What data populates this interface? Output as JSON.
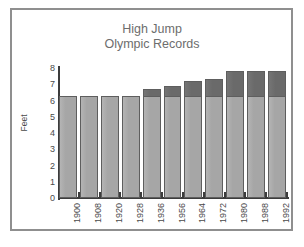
{
  "figure": {
    "background_color": "#ffffff",
    "frame_color": "#8f8f8f"
  },
  "chart_data": {
    "type": "bar",
    "title": "High Jump Olympic Records",
    "title_lines": [
      "High Jump",
      "Olympic Records"
    ],
    "xlabel": "",
    "ylabel": "Feet",
    "ylim": [
      0,
      8
    ],
    "yticks": [
      0,
      1,
      2,
      3,
      4,
      5,
      6,
      7,
      8
    ],
    "ytick_labels": [
      "0",
      "1",
      "2",
      "3",
      "4",
      "5",
      "6",
      "7",
      "8"
    ],
    "grid": false,
    "legend": null,
    "categories": [
      "1900",
      "1908",
      "1920",
      "1928",
      "1936",
      "1956",
      "1964",
      "1972",
      "1980",
      "1988",
      "1992"
    ],
    "values": [
      6.3,
      6.3,
      6.3,
      6.3,
      6.7,
      6.9,
      7.2,
      7.3,
      7.8,
      7.8,
      7.8
    ],
    "base_segment_value": 6.3,
    "series": [
      {
        "name": "Record height (base)",
        "color": "#a6a6a6",
        "values": [
          6.3,
          6.3,
          6.3,
          6.3,
          6.3,
          6.3,
          6.3,
          6.3,
          6.3,
          6.3,
          6.3
        ]
      },
      {
        "name": "Record height (increment)",
        "color": "#6a6a6a",
        "values": [
          0,
          0,
          0,
          0,
          0.4,
          0.6,
          0.9,
          1.0,
          1.5,
          1.5,
          1.5
        ]
      }
    ],
    "colors": {
      "bar_light": "#a6a6a6",
      "bar_dark": "#6a6a6a",
      "bar_outline": "#5e5e5e",
      "axis": "#3c3c3c",
      "text": "#4a4a4a",
      "title_text": "#6d6d6d"
    }
  }
}
